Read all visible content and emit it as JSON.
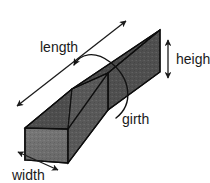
{
  "figure": {
    "background_color": "#ffffff",
    "width_px": 210,
    "height_px": 183
  },
  "labels": {
    "length": "length",
    "height": "height",
    "girth": "girth",
    "width": "width"
  },
  "annotations": [
    {
      "id": "length",
      "text": "length",
      "marker": "double-headed-arrow",
      "orientation": "diagonal-up-right",
      "text_x": 40,
      "text_y": 52,
      "line": {
        "x1": 17,
        "y1": 106,
        "x2": 126,
        "y2": 21
      }
    },
    {
      "id": "height",
      "text": "height",
      "marker": "double-headed-arrow",
      "orientation": "vertical",
      "text_x": 176,
      "text_y": 64,
      "line": {
        "x1": 168,
        "y1": 40,
        "x2": 168,
        "y2": 78
      }
    },
    {
      "id": "girth",
      "text": "girth",
      "marker": "single-headed-curved-arrow",
      "orientation": "wrap-around",
      "text_x": 122,
      "text_y": 124,
      "arrow_tip": {
        "x": 73,
        "y": 66
      }
    },
    {
      "id": "width",
      "text": "width",
      "marker": "double-headed-arrow",
      "orientation": "diagonal-down-right",
      "text_x": 12,
      "text_y": 180,
      "line": {
        "x1": 18,
        "y1": 152,
        "x2": 58,
        "y2": 170
      }
    }
  ],
  "box_faces": {
    "top_face_color": "#4b4b4b",
    "front_face_color": "#5c5c5c",
    "end_cap_color": "#717171",
    "edge_color": "#101010",
    "label_color": "#1a1a1a"
  },
  "box_geometry": {
    "top_far_right": {
      "x": 160,
      "y": 30
    },
    "top_near_right": {
      "x": 108,
      "y": 73
    },
    "top_near_left": {
      "x": 25,
      "y": 128
    },
    "top_far_left": {
      "x": 72,
      "y": 89
    },
    "bottom_near_right": {
      "x": 108,
      "y": 110
    },
    "bottom_near_left": {
      "x": 25,
      "y": 160
    },
    "bottom_far_right": {
      "x": 160,
      "y": 72
    },
    "bottom_front_left": {
      "x": 68,
      "y": 163
    }
  },
  "icons": {
    "arrow_head": "arrowhead-icon",
    "curve": "arc-icon"
  }
}
